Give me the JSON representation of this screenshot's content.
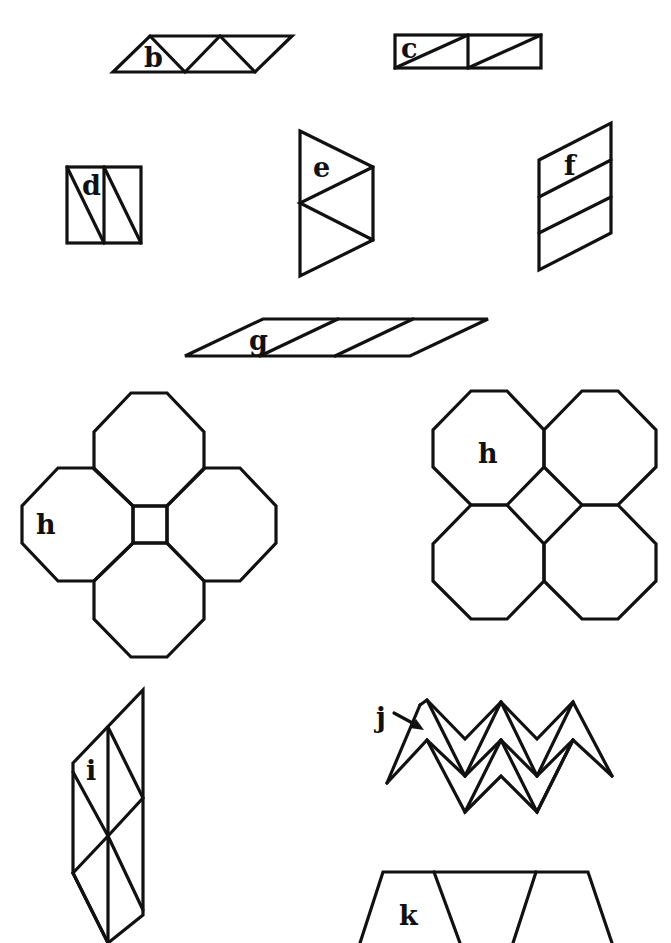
{
  "figure": {
    "stroke_color": "#111111",
    "background": "#ffffff",
    "labels": {
      "b": "b",
      "c": "c",
      "d": "d",
      "e": "e",
      "f": "f",
      "g": "g",
      "h1": "h",
      "h2": "h",
      "i": "i",
      "j": "j",
      "k": "k"
    },
    "items": [
      {
        "id": "b",
        "shape": "parallelogram of 3 triangles"
      },
      {
        "id": "c",
        "shape": "rectangle of 2 squares, each split diagonally"
      },
      {
        "id": "d",
        "shape": "square of 2 rectangles, each split diagonally"
      },
      {
        "id": "e",
        "shape": "trapezoid of 4 triangles"
      },
      {
        "id": "f",
        "shape": "parallelogram of 3 stacked parallelograms"
      },
      {
        "id": "g",
        "shape": "long parallelogram of 3 parallelograms"
      },
      {
        "id": "h",
        "shape": "4 octagons around a central square (two orientations)"
      },
      {
        "id": "i",
        "shape": "tall parallelogram subdivided into triangles"
      },
      {
        "id": "j",
        "shape": "zigzag chevron strip with arrow pointer"
      },
      {
        "id": "k",
        "shape": "trapezoid row (partially visible)"
      }
    ]
  }
}
